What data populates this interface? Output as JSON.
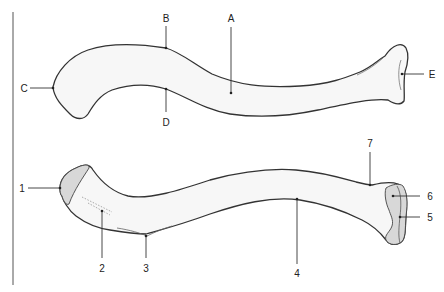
{
  "figure": {
    "divider": {
      "x": 13
    },
    "upper_view": {
      "labels": [
        {
          "id": "A",
          "text": "A"
        },
        {
          "id": "B",
          "text": "B"
        },
        {
          "id": "C",
          "text": "C"
        },
        {
          "id": "D",
          "text": "D"
        },
        {
          "id": "E",
          "text": "E"
        }
      ]
    },
    "lower_view": {
      "labels": [
        {
          "id": "1",
          "text": "1"
        },
        {
          "id": "2",
          "text": "2"
        },
        {
          "id": "3",
          "text": "3"
        },
        {
          "id": "4",
          "text": "4"
        },
        {
          "id": "5",
          "text": "5"
        },
        {
          "id": "6",
          "text": "6"
        },
        {
          "id": "7",
          "text": "7"
        }
      ]
    },
    "colors": {
      "bone_fill": "#f7f7f7",
      "facet_fill": "#d8d8d8",
      "outline": "#333333"
    }
  }
}
